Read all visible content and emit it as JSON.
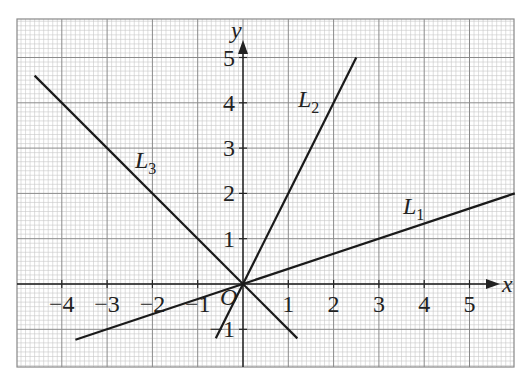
{
  "chart_data": {
    "type": "line",
    "title": "",
    "xlabel": "x",
    "ylabel": "y",
    "origin_label": "O",
    "xlim": [
      -5,
      6
    ],
    "ylim": [
      -1.8,
      5.8
    ],
    "grid": true,
    "x_ticks": [
      -4,
      -3,
      -2,
      -1,
      1,
      2,
      3,
      4,
      5
    ],
    "x_tick_labels": [
      "−4",
      "−3",
      "−2",
      "−1",
      "1",
      "2",
      "3",
      "4",
      "5"
    ],
    "y_ticks": [
      -1,
      1,
      2,
      3,
      4,
      5
    ],
    "y_tick_labels": [
      "−1",
      "1",
      "2",
      "3",
      "4",
      "5"
    ],
    "series": [
      {
        "name": "L1",
        "label": "L",
        "subscript": "1",
        "equation": "y = x/3",
        "x": [
          -3.7,
          6
        ],
        "y": [
          -1.23,
          2
        ]
      },
      {
        "name": "L2",
        "label": "L",
        "subscript": "2",
        "equation": "y = 2x",
        "x": [
          -0.6,
          2.5
        ],
        "y": [
          -1.2,
          5
        ]
      },
      {
        "name": "L3",
        "label": "L",
        "subscript": "3",
        "equation": "y = -x",
        "x": [
          -4.6,
          1.2
        ],
        "y": [
          4.6,
          -1.2
        ]
      }
    ]
  },
  "labels": {
    "x_axis": "x",
    "y_axis": "y",
    "origin": "O",
    "L1": "L",
    "L1_sub": "1",
    "L2": "L",
    "L2_sub": "2",
    "L3": "L",
    "L3_sub": "3"
  }
}
